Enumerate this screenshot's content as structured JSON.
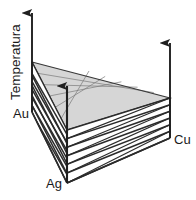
{
  "figure": {
    "kind": "ternary-phase-diagram-3d",
    "axis_label": "Temperatura",
    "vertex_labels": {
      "au": "Au",
      "ag": "Ag",
      "cu": "Cu"
    },
    "colors": {
      "line": "#2b2b2b",
      "surface_fill": "#d5d5d5",
      "background": "#ffffff",
      "text": "#1a1a1a"
    },
    "geometry": {
      "au_vertex": [
        32,
        112
      ],
      "ag_vertex": [
        67,
        183
      ],
      "cu_vertex": [
        170,
        138
      ],
      "surface_au_top": [
        32,
        62
      ],
      "surface_ag_top": [
        67,
        130
      ],
      "surface_cu_top": [
        170,
        98
      ],
      "temperature_arrow": {
        "x": 32,
        "y_base": 112,
        "y_tip": 12
      },
      "ag_arrow": {
        "x": 67,
        "y_base": 183,
        "y_tip": 85
      },
      "cu_arrow": {
        "x": 170,
        "y_base": 138,
        "y_tip": 42
      }
    },
    "isotherm_count": 6,
    "hatch_count": 7
  }
}
